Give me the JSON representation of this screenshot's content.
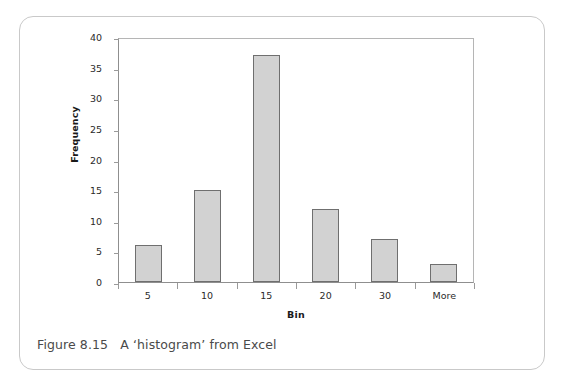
{
  "figure": {
    "caption": "Figure 8.15   A ‘histogram’ from Excel"
  },
  "chart_data": {
    "type": "bar",
    "title": "",
    "xlabel": "Bin",
    "ylabel": "Frequency",
    "categories": [
      "5",
      "10",
      "15",
      "20",
      "30",
      "More"
    ],
    "values": [
      6,
      15,
      37,
      12,
      7,
      3
    ],
    "ylim": [
      0,
      40
    ],
    "y_ticks": [
      0,
      5,
      10,
      15,
      20,
      25,
      30,
      35,
      40
    ],
    "y_tick_labels": [
      "0",
      "5",
      "10",
      "15",
      "20",
      "25",
      "30",
      "35",
      "40"
    ],
    "grid": false,
    "legend": false,
    "bar_fill": "#d2d2d2",
    "bar_border": "#6f6f6f",
    "axis_color": "#8f8f8f"
  }
}
